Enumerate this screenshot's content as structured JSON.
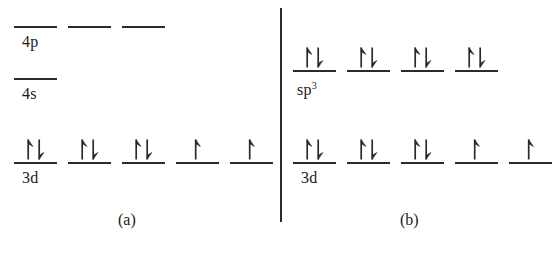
{
  "figure": {
    "background_color": "#ffffff",
    "ink_color": "#2a2a2a",
    "divider": {
      "name": "panel-divider",
      "x": 280,
      "y": 8,
      "height": 214,
      "width": 2
    }
  },
  "panels": [
    {
      "id": "a",
      "caption": "(a)",
      "caption_x": 118,
      "caption_y": 212,
      "rows": [
        {
          "label": "4p",
          "label_x": 22,
          "label_y": 34,
          "rule_y": 26,
          "orbital_width": 43,
          "orbitals": [
            {
              "x": 14,
              "electrons": 0,
              "spins": []
            },
            {
              "x": 68,
              "electrons": 0,
              "spins": []
            },
            {
              "x": 122,
              "electrons": 0,
              "spins": []
            }
          ]
        },
        {
          "label": "4s",
          "label_x": 22,
          "label_y": 86,
          "rule_y": 78,
          "orbital_width": 43,
          "orbitals": [
            {
              "x": 14,
              "electrons": 0,
              "spins": []
            }
          ]
        },
        {
          "label": "3d",
          "label_x": 22,
          "label_y": 170,
          "rule_y": 162,
          "orbital_width": 43,
          "orbitals": [
            {
              "x": 14,
              "electrons": 2,
              "spins": [
                "up",
                "down"
              ]
            },
            {
              "x": 68,
              "electrons": 2,
              "spins": [
                "up",
                "down"
              ]
            },
            {
              "x": 122,
              "electrons": 2,
              "spins": [
                "up",
                "down"
              ]
            },
            {
              "x": 176,
              "electrons": 1,
              "spins": [
                "up"
              ]
            },
            {
              "x": 230,
              "electrons": 1,
              "spins": [
                "up"
              ]
            }
          ]
        }
      ]
    },
    {
      "id": "b",
      "caption": "(b)",
      "caption_x": 400,
      "caption_y": 212,
      "rows": [
        {
          "label": "sp",
          "superscript": "3",
          "label_x": 297,
          "label_y": 82,
          "rule_y": 70,
          "orbital_width": 43,
          "orbitals": [
            {
              "x": 293,
              "electrons": 2,
              "spins": [
                "up",
                "down"
              ]
            },
            {
              "x": 347,
              "electrons": 2,
              "spins": [
                "up",
                "down"
              ]
            },
            {
              "x": 401,
              "electrons": 2,
              "spins": [
                "up",
                "down"
              ]
            },
            {
              "x": 455,
              "electrons": 2,
              "spins": [
                "up",
                "down"
              ]
            }
          ]
        },
        {
          "label": "3d",
          "label_x": 301,
          "label_y": 170,
          "rule_y": 162,
          "orbital_width": 43,
          "orbitals": [
            {
              "x": 293,
              "electrons": 2,
              "spins": [
                "up",
                "down"
              ]
            },
            {
              "x": 347,
              "electrons": 2,
              "spins": [
                "up",
                "down"
              ]
            },
            {
              "x": 401,
              "electrons": 2,
              "spins": [
                "up",
                "down"
              ]
            },
            {
              "x": 455,
              "electrons": 1,
              "spins": [
                "up"
              ]
            },
            {
              "x": 509,
              "electrons": 1,
              "spins": [
                "up"
              ]
            }
          ]
        }
      ]
    }
  ]
}
